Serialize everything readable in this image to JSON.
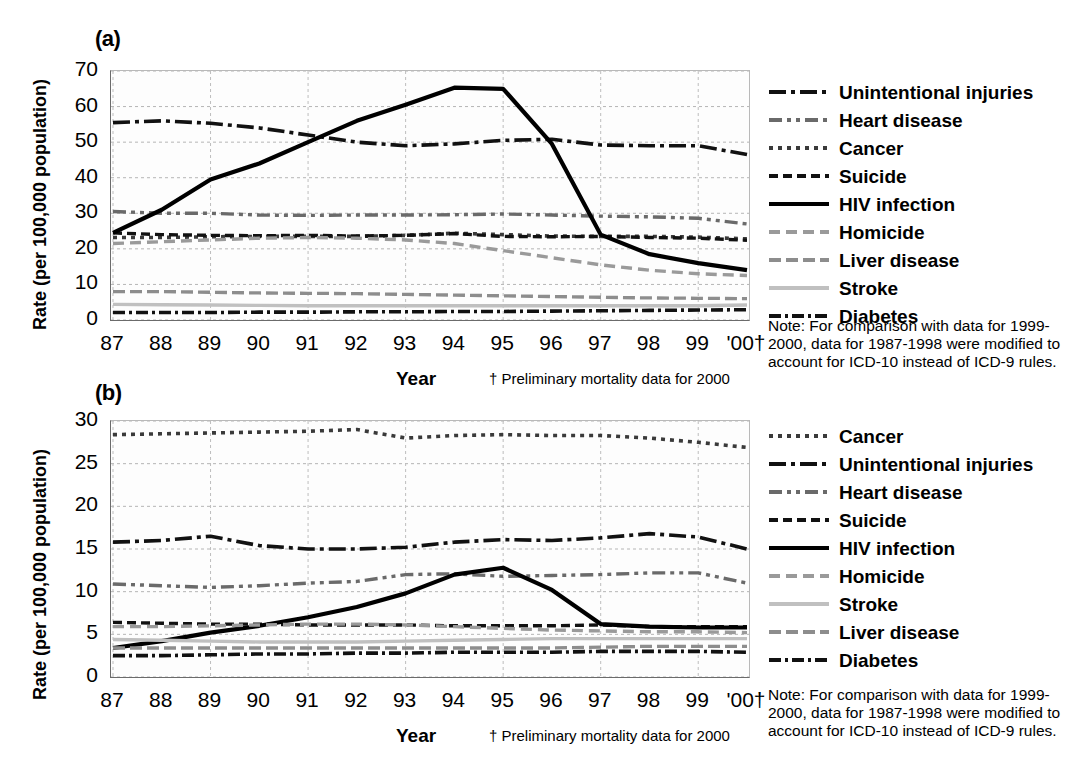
{
  "figure": {
    "panels": [
      {
        "id": "a",
        "label": "(a)",
        "ylabel": "Rate (per 100,000 population)",
        "xlabel": "Year",
        "footnote": "† Preliminary mortality data for 2000",
        "note": "Note: For comparison with data for 1999-2000, data for 1987-1998 were modified to account for ICD-10 instead of ICD-9 rules."
      },
      {
        "id": "b",
        "label": "(b)",
        "ylabel": "Rate (per 100,000 population)",
        "xlabel": "Year",
        "footnote": "† Preliminary mortality data for 2000",
        "note": "Note: For comparison with data for 1999-2000, data for 1987-1998 were modified to account for ICD-10 instead of ICD-9 rules."
      }
    ]
  },
  "chart_data": [
    {
      "type": "line",
      "panel": "a",
      "title": "(a)",
      "xlabel": "Year",
      "ylabel": "Rate (per 100,000 population)",
      "x": [
        "87",
        "88",
        "89",
        "90",
        "91",
        "92",
        "93",
        "94",
        "95",
        "96",
        "97",
        "98",
        "99",
        "'00†"
      ],
      "xlim": [
        1987,
        2000
      ],
      "ylim": [
        0,
        70
      ],
      "yticks": [
        0,
        10,
        20,
        30,
        40,
        50,
        60,
        70
      ],
      "grid": true,
      "legend_position": "right",
      "series": [
        {
          "name": "Unintentional injuries",
          "style": "long-dash-dot",
          "color": "#111111",
          "values": [
            55.5,
            56.0,
            55.3,
            54.0,
            52.0,
            50.0,
            49.0,
            49.5,
            50.5,
            50.8,
            49.2,
            49.0,
            49.0,
            46.5
          ]
        },
        {
          "name": "Heart disease",
          "style": "dash-dot-dot",
          "color": "#6a6a6a",
          "values": [
            30.5,
            30.0,
            30.0,
            29.5,
            29.4,
            29.5,
            29.5,
            29.6,
            29.8,
            29.5,
            29.2,
            29.0,
            28.6,
            27.0
          ]
        },
        {
          "name": "Cancer",
          "style": "dotted",
          "color": "#3a3a3a",
          "values": [
            23.2,
            23.2,
            23.4,
            23.5,
            23.5,
            23.5,
            23.8,
            24.4,
            24.0,
            23.6,
            23.5,
            23.5,
            23.3,
            22.8
          ]
        },
        {
          "name": "Suicide",
          "style": "dashed",
          "color": "#111111",
          "values": [
            24.5,
            24.0,
            23.8,
            23.7,
            23.8,
            23.6,
            23.8,
            24.3,
            23.5,
            23.4,
            23.5,
            23.2,
            23.0,
            22.4
          ]
        },
        {
          "name": "HIV infection",
          "style": "solid",
          "color": "#000000",
          "values": [
            24.5,
            31.0,
            39.5,
            44.0,
            50.0,
            56.0,
            60.5,
            65.3,
            65.0,
            49.5,
            24.0,
            18.5,
            16.0,
            14.0
          ]
        },
        {
          "name": "Homicide",
          "style": "dashed-gray",
          "color": "#9a9a9a",
          "values": [
            21.5,
            22.0,
            22.5,
            23.0,
            23.2,
            23.0,
            22.5,
            21.5,
            19.5,
            17.5,
            15.5,
            14.0,
            13.0,
            12.5
          ]
        },
        {
          "name": "Liver disease",
          "style": "dashed-midgray",
          "color": "#8d8d8d",
          "values": [
            8.0,
            8.0,
            7.8,
            7.6,
            7.5,
            7.4,
            7.2,
            7.0,
            6.8,
            6.6,
            6.4,
            6.2,
            6.1,
            6.0
          ]
        },
        {
          "name": "Stroke",
          "style": "solid-light",
          "color": "#c0c0c0",
          "values": [
            4.4,
            4.3,
            4.2,
            4.1,
            4.0,
            4.0,
            4.0,
            4.0,
            4.0,
            4.0,
            4.0,
            4.0,
            4.0,
            4.2
          ]
        },
        {
          "name": "Diabetes",
          "style": "dash-dot",
          "color": "#111111",
          "values": [
            2.1,
            2.1,
            2.1,
            2.2,
            2.2,
            2.3,
            2.3,
            2.4,
            2.4,
            2.5,
            2.6,
            2.7,
            2.8,
            2.9
          ]
        }
      ]
    },
    {
      "type": "line",
      "panel": "b",
      "title": "(b)",
      "xlabel": "Year",
      "ylabel": "Rate (per 100,000 population)",
      "x": [
        "87",
        "88",
        "89",
        "90",
        "91",
        "92",
        "93",
        "94",
        "95",
        "96",
        "97",
        "98",
        "99",
        "'00†"
      ],
      "xlim": [
        1987,
        2000
      ],
      "ylim": [
        0,
        30
      ],
      "yticks": [
        0,
        5,
        10,
        15,
        20,
        25,
        30
      ],
      "grid": true,
      "legend_position": "right",
      "series": [
        {
          "name": "Cancer",
          "style": "dotted",
          "color": "#3a3a3a",
          "values": [
            28.4,
            28.5,
            28.6,
            28.7,
            28.8,
            29.0,
            28.0,
            28.3,
            28.4,
            28.3,
            28.3,
            28.0,
            27.5,
            26.9
          ]
        },
        {
          "name": "Unintentional injuries",
          "style": "long-dash-dot",
          "color": "#111111",
          "values": [
            15.8,
            16.0,
            16.5,
            15.4,
            15.0,
            15.0,
            15.2,
            15.8,
            16.1,
            16.0,
            16.3,
            16.8,
            16.4,
            15.0
          ]
        },
        {
          "name": "Heart disease",
          "style": "dash-dot-dot",
          "color": "#6a6a6a",
          "values": [
            10.9,
            10.7,
            10.5,
            10.7,
            11.0,
            11.2,
            12.0,
            12.1,
            11.8,
            11.9,
            12.0,
            12.2,
            12.2,
            11.0
          ]
        },
        {
          "name": "Suicide",
          "style": "dashed",
          "color": "#111111",
          "values": [
            6.4,
            6.3,
            6.2,
            6.2,
            6.1,
            6.1,
            6.1,
            6.0,
            6.0,
            6.0,
            6.1,
            5.9,
            5.9,
            5.9
          ]
        },
        {
          "name": "HIV infection",
          "style": "solid",
          "color": "#000000",
          "values": [
            3.4,
            4.2,
            5.2,
            6.0,
            7.0,
            8.2,
            9.8,
            12.0,
            12.8,
            10.2,
            6.2,
            5.9,
            5.8,
            5.8
          ]
        },
        {
          "name": "Homicide",
          "style": "dashed-gray",
          "color": "#9a9a9a",
          "values": [
            5.9,
            5.9,
            6.0,
            6.1,
            6.2,
            6.2,
            6.1,
            5.9,
            5.7,
            5.5,
            5.4,
            5.3,
            5.3,
            5.2
          ]
        },
        {
          "name": "Stroke",
          "style": "solid-light",
          "color": "#c0c0c0",
          "values": [
            4.4,
            4.3,
            4.2,
            4.1,
            4.1,
            4.1,
            4.2,
            4.3,
            4.4,
            4.5,
            4.5,
            4.5,
            4.5,
            4.5
          ]
        },
        {
          "name": "Liver disease",
          "style": "dashed-midgray",
          "color": "#8d8d8d",
          "values": [
            3.4,
            3.4,
            3.4,
            3.4,
            3.4,
            3.4,
            3.4,
            3.4,
            3.4,
            3.4,
            3.5,
            3.6,
            3.6,
            3.6
          ]
        },
        {
          "name": "Diabetes",
          "style": "dash-dot",
          "color": "#111111",
          "values": [
            2.5,
            2.5,
            2.6,
            2.7,
            2.7,
            2.8,
            2.8,
            2.9,
            2.9,
            2.9,
            3.0,
            3.0,
            3.0,
            2.9
          ]
        }
      ]
    }
  ],
  "legend_a": {
    "items": [
      {
        "label": "Unintentional injuries",
        "style": "long-dash-dot",
        "color": "#111111"
      },
      {
        "label": "Heart disease",
        "style": "dash-dot-dot",
        "color": "#6a6a6a"
      },
      {
        "label": "Cancer",
        "style": "dotted",
        "color": "#3a3a3a"
      },
      {
        "label": "Suicide",
        "style": "dashed",
        "color": "#111111"
      },
      {
        "label": "HIV infection",
        "style": "solid",
        "color": "#000000"
      },
      {
        "label": "Homicide",
        "style": "dashed-gray",
        "color": "#9a9a9a"
      },
      {
        "label": "Liver disease",
        "style": "dashed-midgray",
        "color": "#8d8d8d"
      },
      {
        "label": "Stroke",
        "style": "solid-light",
        "color": "#c0c0c0"
      },
      {
        "label": "Diabetes",
        "style": "dash-dot",
        "color": "#111111"
      }
    ]
  },
  "legend_b": {
    "items": [
      {
        "label": "Cancer",
        "style": "dotted",
        "color": "#3a3a3a"
      },
      {
        "label": "Unintentional injuries",
        "style": "long-dash-dot",
        "color": "#111111"
      },
      {
        "label": "Heart disease",
        "style": "dash-dot-dot",
        "color": "#6a6a6a"
      },
      {
        "label": "Suicide",
        "style": "dashed",
        "color": "#111111"
      },
      {
        "label": "HIV infection",
        "style": "solid",
        "color": "#000000"
      },
      {
        "label": "Homicide",
        "style": "dashed-gray",
        "color": "#9a9a9a"
      },
      {
        "label": "Stroke",
        "style": "solid-light",
        "color": "#c0c0c0"
      },
      {
        "label": "Liver disease",
        "style": "dashed-midgray",
        "color": "#8d8d8d"
      },
      {
        "label": "Diabetes",
        "style": "dash-dot",
        "color": "#111111"
      }
    ]
  }
}
